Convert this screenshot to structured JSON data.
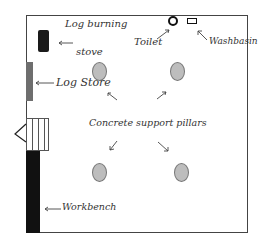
{
  "labels": {
    "stove": [
      "Log burning",
      "stove"
    ],
    "log_store": "Log Store",
    "toilet": "Toilet",
    "washbasin": "Washbasin",
    "pillars": "Concrete support pillars",
    "workbench": "Workbench"
  },
  "colors": {
    "wall": "#444444",
    "stove": "#1a1a1a",
    "log_store": "#6e6e6e",
    "workbench": "#111111",
    "pillar_fill": "#bdbdbd",
    "pillar_stroke": "#777777",
    "text": "#333333"
  }
}
